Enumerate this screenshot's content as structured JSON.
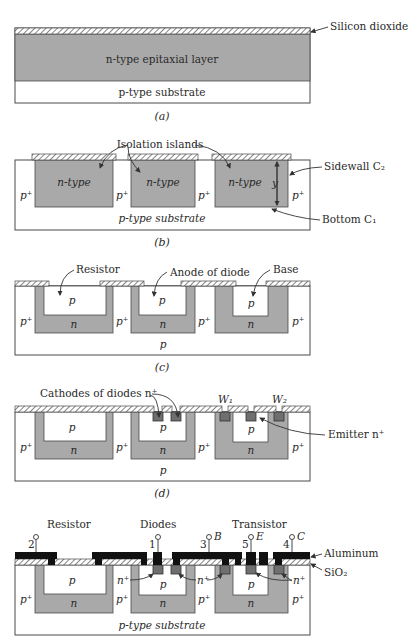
{
  "panels": {
    "a": {
      "caption": "(a)",
      "labels": {
        "oxide": "Silicon dioxide",
        "epi": "n-type epitaxial layer",
        "substrate": "p-type substrate"
      }
    },
    "b": {
      "caption": "(b)",
      "labels": {
        "islands": "Isolation islands",
        "ntype": "n-type",
        "pplus": "p⁺",
        "substrate": "p-type substrate",
        "sidewall": "Sidewall C₂",
        "bottom": "Bottom C₁",
        "depth": "y"
      }
    },
    "c": {
      "caption": "(c)",
      "labels": {
        "resistor": "Resistor",
        "anode": "Anode of diode",
        "base": "Base",
        "p": "p",
        "n": "n",
        "pplus": "p⁺"
      }
    },
    "d": {
      "caption": "(d)",
      "labels": {
        "cathodes": "Cathodes of diodes n⁺",
        "w1": "W₁",
        "w2": "W₂",
        "emitter": "Emitter  n⁺",
        "p": "p",
        "n": "n",
        "pplus": "p⁺"
      }
    },
    "e": {
      "labels": {
        "resistor": "Resistor",
        "diodes": "Diodes",
        "transistor": "Transistor",
        "aluminum": "Aluminum",
        "sio2": "SiO₂",
        "substrate": "p-type substrate",
        "nplus": "n⁺",
        "p": "p",
        "n": "n",
        "pplus": "p⁺"
      },
      "terminals": [
        {
          "num": "2",
          "name": ""
        },
        {
          "num": "1",
          "name": ""
        },
        {
          "num": "3",
          "name": "B"
        },
        {
          "num": "5",
          "name": "E"
        },
        {
          "num": "4",
          "name": "C"
        }
      ]
    }
  }
}
